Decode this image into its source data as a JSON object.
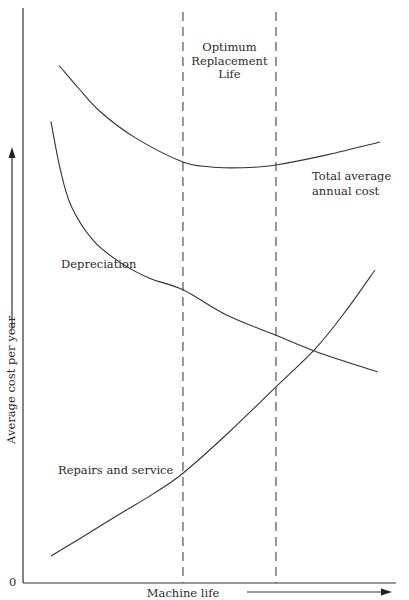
{
  "chart_data": {
    "type": "line",
    "title": "",
    "xlabel": "Machine life",
    "ylabel": "Average cost per year",
    "origin_label": "0",
    "xlim": [
      0,
      10
    ],
    "ylim": [
      0,
      10
    ],
    "grid": false,
    "x_ticks": [],
    "y_ticks": [],
    "series": [
      {
        "name": "Total average annual cost",
        "label_lines": [
          "Total average",
          "annual cost"
        ],
        "points": [
          [
            0.97,
            9.0
          ],
          [
            1.5,
            8.6
          ],
          [
            2.07,
            8.2
          ],
          [
            3.0,
            7.75
          ],
          [
            4.3,
            7.32
          ],
          [
            5.0,
            7.24
          ],
          [
            5.56,
            7.22
          ],
          [
            6.2,
            7.23
          ],
          [
            6.8,
            7.27
          ],
          [
            8.2,
            7.45
          ],
          [
            9.6,
            7.67
          ]
        ]
      },
      {
        "name": "Depreciation",
        "label_lines": [
          "Depreciation"
        ],
        "points": [
          [
            0.75,
            8.03
          ],
          [
            1.0,
            7.2
          ],
          [
            1.3,
            6.55
          ],
          [
            1.9,
            5.95
          ],
          [
            2.6,
            5.58
          ],
          [
            3.4,
            5.3
          ],
          [
            4.3,
            5.1
          ],
          [
            5.5,
            4.65
          ],
          [
            6.8,
            4.31
          ],
          [
            7.9,
            4.02
          ],
          [
            9.54,
            3.67
          ]
        ]
      },
      {
        "name": "Repairs and service",
        "label_lines": [
          "Repairs and service"
        ],
        "points": [
          [
            0.75,
            0.47
          ],
          [
            1.6,
            0.8
          ],
          [
            2.6,
            1.2
          ],
          [
            3.5,
            1.55
          ],
          [
            4.3,
            1.91
          ],
          [
            5.5,
            2.6
          ],
          [
            6.8,
            3.41
          ],
          [
            7.88,
            4.09
          ],
          [
            8.7,
            4.75
          ],
          [
            9.46,
            5.44
          ]
        ]
      }
    ],
    "annotations": [
      {
        "text_lines": [
          "Optimum",
          "Replacement",
          "Life"
        ],
        "type": "region",
        "x_range": [
          4.3,
          6.8
        ],
        "style": "dashed vertical boundaries"
      }
    ]
  }
}
